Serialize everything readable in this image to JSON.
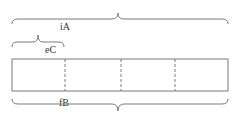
{
  "diagram": {
    "labels": {
      "top_brace": "iA",
      "small_brace": "eC",
      "bottom_brace": "fB"
    },
    "segments": 4,
    "stroke_color": "#7a7a7a"
  }
}
